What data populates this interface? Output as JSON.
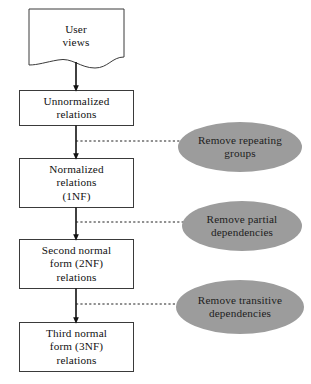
{
  "diagram": {
    "type": "flowchart",
    "title_visible": false,
    "colors": {
      "background": "#ffffff",
      "box_stroke": "#3a3a3a",
      "box_fill": "#ffffff",
      "arrow": "#111111",
      "dashed_connector": "#222222",
      "ellipse_fill": "#9c9c9c",
      "ellipse_text": "#1c1c1c",
      "node_text": "#111111"
    },
    "nodes": [
      {
        "id": "user-views",
        "shape": "document",
        "lines": [
          "User",
          "views"
        ]
      },
      {
        "id": "unnormalized-relations",
        "shape": "rectangle",
        "lines": [
          "Unnormalized",
          "relations"
        ]
      },
      {
        "id": "normalized-relations-1nf",
        "shape": "rectangle",
        "lines": [
          "Normalized",
          "relations",
          "(1NF)"
        ]
      },
      {
        "id": "second-normal-form-2nf",
        "shape": "rectangle",
        "lines": [
          "Second normal",
          "form (2NF)",
          "relations"
        ]
      },
      {
        "id": "third-normal-form-3nf",
        "shape": "rectangle",
        "lines": [
          "Third normal",
          "form (3NF)",
          "relations"
        ]
      }
    ],
    "annotations": [
      {
        "id": "remove-repeating-groups",
        "shape": "ellipse",
        "lines": [
          "Remove repeating",
          "groups"
        ]
      },
      {
        "id": "remove-partial-dependencies",
        "shape": "ellipse",
        "lines": [
          "Remove partial",
          "dependencies"
        ]
      },
      {
        "id": "remove-transitive-dependencies",
        "shape": "ellipse",
        "lines": [
          "Remove transitive",
          "dependencies"
        ]
      }
    ],
    "edges": [
      {
        "id": "edge-user-views-to-unnormalized",
        "style": "solid-arrow"
      },
      {
        "id": "edge-unnormalized-to-1nf",
        "style": "solid-arrow"
      },
      {
        "id": "edge-1nf-to-2nf",
        "style": "solid-arrow"
      },
      {
        "id": "edge-2nf-to-3nf",
        "style": "solid-arrow"
      },
      {
        "id": "connector-repeating-groups",
        "style": "dashed"
      },
      {
        "id": "connector-partial-dependencies",
        "style": "dashed"
      },
      {
        "id": "connector-transitive-dependencies",
        "style": "dashed"
      }
    ]
  }
}
